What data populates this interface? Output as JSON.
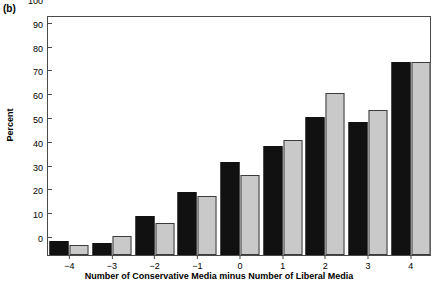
{
  "figure": {
    "panel_label": "(b)"
  },
  "chart_data": {
    "type": "bar",
    "title": "",
    "panel": "(b)",
    "xlabel": "Number of Conservative Media minus Number of Liberal Media",
    "ylabel": "Percent",
    "categories": [
      "-4",
      "-3",
      "-2",
      "-1",
      "0",
      "1",
      "2",
      "3",
      "4"
    ],
    "xtick_labels": [
      "−4",
      "−3",
      "−2",
      "−1",
      "0",
      "1",
      "2",
      "3",
      "4"
    ],
    "ytick_labels": [
      "0",
      "10",
      "20",
      "30",
      "40",
      "50",
      "60",
      "70",
      "80",
      "90",
      "100"
    ],
    "ytick_values": [
      0,
      10,
      20,
      30,
      40,
      50,
      60,
      70,
      80,
      90,
      100
    ],
    "ylim": [
      0,
      100
    ],
    "grid": false,
    "legend": "none",
    "series": [
      {
        "name": "series-1",
        "color": "#111111",
        "values": [
          6,
          5,
          16.5,
          26.5,
          39,
          46,
          58,
          56,
          81
        ]
      },
      {
        "name": "series-2",
        "color": "#c9c9c9",
        "values": [
          4,
          8,
          13.5,
          25,
          33.5,
          48.5,
          68,
          61,
          81
        ]
      }
    ]
  }
}
